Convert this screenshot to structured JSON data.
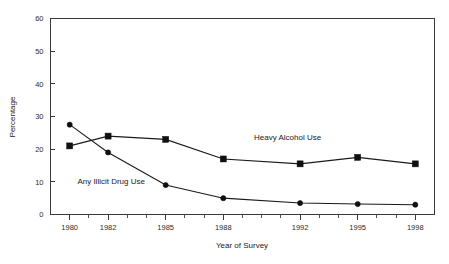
{
  "chart_data": {
    "type": "line",
    "title": "",
    "xlabel": "Year of Survey",
    "ylabel": "Percentage",
    "categories": [
      "1980",
      "1982",
      "1985",
      "1988",
      "1992",
      "1995",
      "1998"
    ],
    "x": [
      1980,
      1982,
      1985,
      1988,
      1992,
      1995,
      1998
    ],
    "xlim": [
      1979,
      1999
    ],
    "ylim": [
      0,
      60
    ],
    "yticks": [
      0,
      10,
      20,
      30,
      40,
      50,
      60
    ],
    "ytick_labels": [
      "0",
      "10",
      "20",
      "30",
      "40",
      "50",
      "60"
    ],
    "xtick_labels": [
      "1980",
      "1982",
      "1985",
      "1988",
      "1992",
      "1995",
      "1998"
    ],
    "grid": false,
    "legend_position": "inline-annotation",
    "series": [
      {
        "name": "Heavy Alcohol Use",
        "marker": "square",
        "color": "#101010",
        "values": [
          21,
          24,
          23,
          17,
          15.5,
          17.5,
          15.5
        ]
      },
      {
        "name": "Any Illicit Drug Use",
        "marker": "circle",
        "color": "#101010",
        "values": [
          27.5,
          19,
          9,
          5,
          3.5,
          3.2,
          3
        ]
      }
    ],
    "annotations": [
      {
        "text": "Heavy Alcohol Use",
        "x": 1989.6,
        "y": 22.8
      },
      {
        "text": "Any Illicit Drug Use",
        "x": 1980.4,
        "y": 9.2
      }
    ]
  }
}
